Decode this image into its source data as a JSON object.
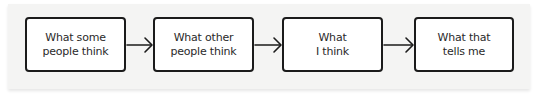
{
  "diagram": {
    "type": "flowchart",
    "direction": "left-to-right",
    "nodes": [
      {
        "id": "n1",
        "line1": "What some",
        "line2": "people think"
      },
      {
        "id": "n2",
        "line1": "What other",
        "line2": "people think"
      },
      {
        "id": "n3",
        "line1": "What",
        "line2": "I think"
      },
      {
        "id": "n4",
        "line1": "What that",
        "line2": "tells me"
      }
    ],
    "edges": [
      {
        "from": "n1",
        "to": "n2"
      },
      {
        "from": "n2",
        "to": "n3"
      },
      {
        "from": "n3",
        "to": "n4"
      }
    ],
    "colors": {
      "background": "#f4f4f3",
      "box_fill": "#ffffff",
      "stroke": "#1b1b1b",
      "text": "#2a2a2a"
    }
  }
}
